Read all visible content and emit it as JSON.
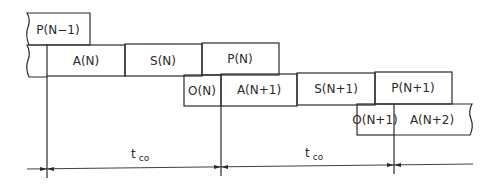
{
  "diagram": {
    "type": "pipeline-timing",
    "stroke_color": "#2a2a2a",
    "rows": [
      {
        "row": 1,
        "blocks": [
          {
            "label": "P(N−1)"
          }
        ]
      },
      {
        "row": 2,
        "blocks": [
          {
            "label": "A(N)"
          },
          {
            "label": "S(N)"
          },
          {
            "label": "P(N)"
          }
        ]
      },
      {
        "row": 3,
        "blocks": [
          {
            "label": "O(N)"
          },
          {
            "label": "A(N+1)"
          },
          {
            "label": "S(N+1)"
          },
          {
            "label": "P(N+1)"
          }
        ]
      },
      {
        "row": 4,
        "blocks": [
          {
            "label": "O(N+1)"
          },
          {
            "label": "A(N+2)"
          }
        ]
      }
    ],
    "intervals": [
      {
        "label_main": "t",
        "label_sub": "co"
      },
      {
        "label_main": "t",
        "label_sub": "co"
      }
    ]
  }
}
